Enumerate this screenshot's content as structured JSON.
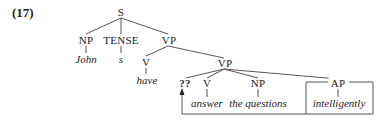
{
  "example_number": "(17)",
  "tree": {
    "S": "S",
    "NP_subject": "NP",
    "TENSE": "TENSE",
    "VP_upper": "VP",
    "V_have": "V",
    "VP_lower": "VP",
    "gap": "??",
    "V_answer": "V",
    "NP_object": "NP",
    "AP": "AP"
  },
  "words": {
    "john": "John",
    "s": "s",
    "have": "have",
    "answer": "answer",
    "the_questions": "the questions",
    "intelligently": "intelligently"
  },
  "annotations": {
    "box_around": "AP",
    "arrow_from": "AP",
    "arrow_to": "??"
  },
  "colors": {
    "ink": "#222222",
    "lines": "#555555",
    "background": "#ffffff"
  }
}
